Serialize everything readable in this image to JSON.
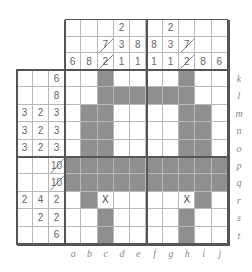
{
  "puzzle": {
    "type": "nonogram",
    "columns": [
      "a",
      "b",
      "c",
      "d",
      "e",
      "f",
      "g",
      "h",
      "i",
      "j"
    ],
    "rows": [
      "k",
      "l",
      "m",
      "n",
      "o",
      "p",
      "q",
      "r",
      "s",
      "t"
    ],
    "column_clues": [
      [
        "",
        "",
        "6"
      ],
      [
        "",
        "",
        "8"
      ],
      [
        "",
        "7/",
        "2/"
      ],
      [
        "2",
        "3",
        "1"
      ],
      [
        "",
        "8",
        "1"
      ],
      [
        "",
        "8",
        "1"
      ],
      [
        "2",
        "3",
        "1"
      ],
      [
        "",
        "7/",
        "2/"
      ],
      [
        "",
        "",
        "8"
      ],
      [
        "",
        "",
        "6"
      ]
    ],
    "row_clues": [
      [
        "",
        "",
        "6"
      ],
      [
        "",
        "",
        "8"
      ],
      [
        "3",
        "2",
        "3"
      ],
      [
        "3",
        "2",
        "3"
      ],
      [
        "3",
        "2",
        "3"
      ],
      [
        "",
        "",
        "10/"
      ],
      [
        "",
        "",
        "10/"
      ],
      [
        "2",
        "4",
        "2"
      ],
      [
        "",
        "2",
        "2"
      ],
      [
        "",
        "",
        "6"
      ]
    ],
    "grid": [
      "..#....#..",
      "..######..",
      ".##....##.",
      ".##....##.",
      ".##....##.",
      "##########",
      "##########",
      ".#X....X#.",
      "..#....#..",
      "..#....#.."
    ],
    "colors": {
      "filled": "#8f8f8f",
      "empty": "#ffffff",
      "thick_line": "#555555",
      "thin_line": "#b8b8b8"
    }
  }
}
